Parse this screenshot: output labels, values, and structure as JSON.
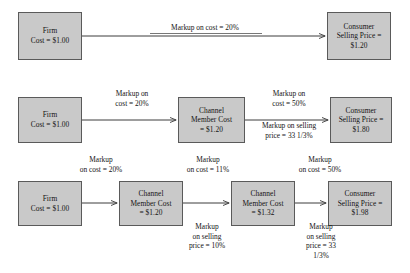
{
  "diagram": {
    "colors": {
      "box_fill": "#c9c9c9",
      "box_border": "#5a5a5a",
      "arrow": "#3c3c3c",
      "text": "#141414",
      "background": "#ffffff"
    },
    "rows": [
      {
        "id": "row-1",
        "boxes": [
          {
            "id": "row1-firm",
            "name": "firm-box",
            "lines": [
              "Firm",
              "Cost = $1.00"
            ]
          },
          {
            "id": "row1-consumer",
            "name": "consumer-box",
            "lines": [
              "Consumer",
              "Selling Price =",
              "$1.20"
            ]
          }
        ],
        "labels": [
          {
            "id": "row1-markup",
            "name": "markup-on-cost-label",
            "lines": [
              "Markup on cost = 20%"
            ]
          }
        ]
      },
      {
        "id": "row-2",
        "boxes": [
          {
            "id": "row2-firm",
            "name": "firm-box",
            "lines": [
              "Firm",
              "Cost = $1.00"
            ]
          },
          {
            "id": "row2-channel",
            "name": "channel-member-box",
            "lines": [
              "Channel",
              "Member Cost",
              "= $1.20"
            ]
          },
          {
            "id": "row2-consumer",
            "name": "consumer-box",
            "lines": [
              "Consumer",
              "Selling Price =",
              "$1.80"
            ]
          }
        ],
        "labels": [
          {
            "id": "row2-markup-1",
            "name": "markup-on-cost-label",
            "lines": [
              "Markup on",
              "cost = 20%"
            ]
          },
          {
            "id": "row2-markup-2",
            "name": "markup-on-cost-label",
            "lines": [
              "Markup on",
              "cost = 50%"
            ]
          },
          {
            "id": "row2-markup-3",
            "name": "markup-on-selling-price-label",
            "lines": [
              "Markup on selling",
              "price = 33 1/3%"
            ]
          }
        ]
      },
      {
        "id": "row-3",
        "boxes": [
          {
            "id": "row3-firm",
            "name": "firm-box",
            "lines": [
              "Firm",
              "Cost = $1.00"
            ]
          },
          {
            "id": "row3-channel-1",
            "name": "channel-member-box",
            "lines": [
              "Channel",
              "Member Cost",
              "= $1.20"
            ]
          },
          {
            "id": "row3-channel-2",
            "name": "channel-member-box",
            "lines": [
              "Channel",
              "Member Cost",
              "= $1.32"
            ]
          },
          {
            "id": "row3-consumer",
            "name": "consumer-box",
            "lines": [
              "Consumer",
              "Selling Price =",
              "$1.98"
            ]
          }
        ],
        "labels": [
          {
            "id": "row3-markup-top-1",
            "name": "markup-on-cost-label",
            "lines": [
              "Markup",
              "on cost = 20%"
            ]
          },
          {
            "id": "row3-markup-top-2",
            "name": "markup-on-cost-label",
            "lines": [
              "Markup",
              "on cost = 11%"
            ]
          },
          {
            "id": "row3-markup-top-3",
            "name": "markup-on-cost-label",
            "lines": [
              "Markup",
              "on cost = 50%"
            ]
          },
          {
            "id": "row3-markup-bottom-1",
            "name": "markup-on-selling-price-label",
            "lines": [
              "Markup",
              "on selling",
              "price = 10%"
            ]
          },
          {
            "id": "row3-markup-bottom-2",
            "name": "markup-on-selling-price-label",
            "lines": [
              "Markup",
              "on selling",
              "price = 33",
              "1/3%"
            ]
          }
        ]
      }
    ]
  }
}
